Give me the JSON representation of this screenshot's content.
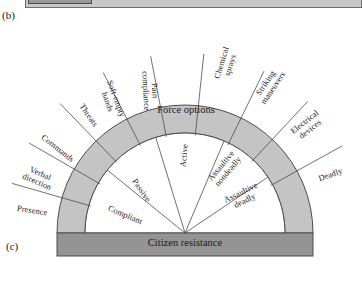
{
  "figure": {
    "panel_b_label": "(b)",
    "panel_c_label": "(c)",
    "band_label": "Force options",
    "base_label": "Citizen resistance"
  },
  "colors": {
    "band_fill": "#c4c4c4",
    "base_fill": "#949494",
    "stroke": "#4d4d4d",
    "top_strip_fill": "#c8c8c8",
    "top_strip_inner_fill": "#9a9a9a"
  },
  "force_options": [
    {
      "id": "presence",
      "label": "Presence",
      "angle": 171
    },
    {
      "id": "verbal-direction",
      "label": "Verbal\ndirection",
      "angle": 157
    },
    {
      "id": "commands",
      "label": "Commands",
      "angle": 142
    },
    {
      "id": "threats",
      "label": "Threats",
      "angle": 125
    },
    {
      "id": "soft-empty-hands",
      "label": "Soft-empty\nhands",
      "angle": 110
    },
    {
      "id": "pain-compliance",
      "label": "Pain\ncompliance",
      "angle": 93
    },
    {
      "id": "chemical-sprays",
      "label": "Chemical\nsprays",
      "angle": 73
    },
    {
      "id": "striking-maneuvers",
      "label": "Striking\nmaneuvers",
      "angle": 56
    },
    {
      "id": "electrical-devices",
      "label": "Electrical\ndevices",
      "angle": 38
    },
    {
      "id": "deadly",
      "label": "Deadly",
      "angle": 20
    }
  ],
  "citizen_resistance": [
    {
      "id": "compliant",
      "label": "Compliant",
      "angle": 157
    },
    {
      "id": "passive",
      "label": "Passive",
      "angle": 124
    },
    {
      "id": "active",
      "label": "Active",
      "angle": 84
    },
    {
      "id": "assaultive-nondeadly",
      "label": "Assaultive\nnondeadly",
      "angle": 50
    },
    {
      "id": "assaultive-deadly",
      "label": "Assaultive\ndeadly",
      "angle": 26
    }
  ],
  "geometry": {
    "cx": 185,
    "cy": 233,
    "outer_r": 128,
    "inner_r": 100,
    "base_bar": {
      "x": 57,
      "y": 233,
      "w": 256,
      "h": 23
    },
    "inner_divider_angles": [
      141,
      107,
      67,
      34
    ],
    "outer_divider_angles": [
      164,
      150,
      134,
      117,
      101,
      84,
      64,
      47,
      29
    ]
  }
}
